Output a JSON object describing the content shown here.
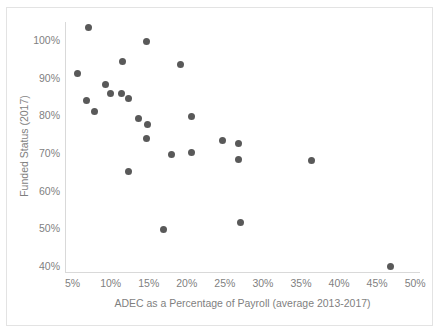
{
  "chart_data": {
    "type": "scatter",
    "title": "",
    "xlabel": "ADEC as a Percentage of Payroll (average 2013-2017)",
    "ylabel": "Funded Status (2017)",
    "xlim": [
      4.0,
      50.5
    ],
    "ylim": [
      38.5,
      105.0
    ],
    "xticks": [
      5,
      10,
      15,
      20,
      25,
      30,
      35,
      40,
      45,
      50
    ],
    "xtick_labels": [
      "5%",
      "10%",
      "15%",
      "20%",
      "25%",
      "30%",
      "35%",
      "40%",
      "45%",
      "50%"
    ],
    "yticks": [
      40,
      50,
      60,
      70,
      80,
      90,
      100
    ],
    "ytick_labels": [
      "40%",
      "50%",
      "60%",
      "70%",
      "80%",
      "90%",
      "100%"
    ],
    "grid": false,
    "legend": null,
    "marker_color": "#595959",
    "axis_color": "#d9d9d9",
    "text_color": "#7f7f7f",
    "points": [
      {
        "x": 7.1,
        "y": 103.5
      },
      {
        "x": 14.7,
        "y": 99.8
      },
      {
        "x": 11.6,
        "y": 94.5
      },
      {
        "x": 19.2,
        "y": 93.8
      },
      {
        "x": 5.6,
        "y": 91.2
      },
      {
        "x": 9.3,
        "y": 88.3
      },
      {
        "x": 10.0,
        "y": 86.0
      },
      {
        "x": 11.4,
        "y": 86.0
      },
      {
        "x": 12.4,
        "y": 84.7
      },
      {
        "x": 6.8,
        "y": 84.0
      },
      {
        "x": 7.9,
        "y": 81.1
      },
      {
        "x": 20.6,
        "y": 79.8
      },
      {
        "x": 13.6,
        "y": 79.3
      },
      {
        "x": 14.8,
        "y": 77.8
      },
      {
        "x": 14.7,
        "y": 74.0
      },
      {
        "x": 24.7,
        "y": 73.6
      },
      {
        "x": 26.8,
        "y": 72.6
      },
      {
        "x": 20.6,
        "y": 70.2
      },
      {
        "x": 18.0,
        "y": 69.8
      },
      {
        "x": 26.8,
        "y": 68.3
      },
      {
        "x": 36.4,
        "y": 68.1
      },
      {
        "x": 12.4,
        "y": 65.3
      },
      {
        "x": 27.1,
        "y": 51.6
      },
      {
        "x": 17.0,
        "y": 49.8
      },
      {
        "x": 46.7,
        "y": 40.0
      }
    ]
  }
}
